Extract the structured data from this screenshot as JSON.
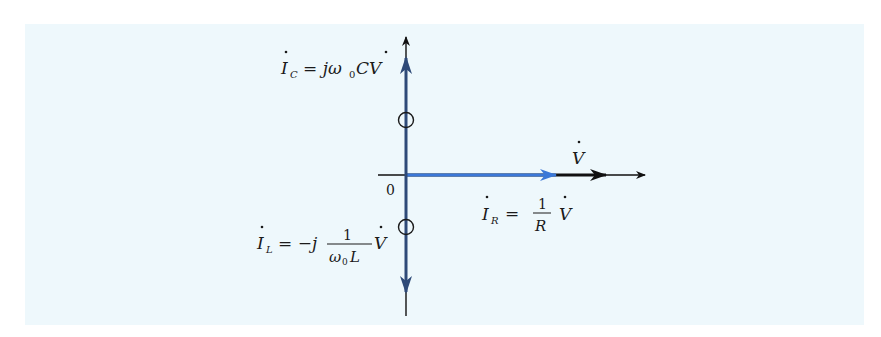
{
  "diagram": {
    "type": "phasor-diagram",
    "colors": {
      "background": "#eef8fc",
      "axis": "#111111",
      "voltage_phasor": "#111111",
      "resistor_current_phasor": "#3b78d8",
      "reactive_current_phasor": "#2e4a78"
    },
    "origin_label": "0",
    "phasors": [
      {
        "id": "V",
        "label_main": "V",
        "dot": true,
        "direction": "right",
        "magnitude_relative": 1.0
      },
      {
        "id": "IR",
        "label_lhs_main": "I",
        "label_lhs_sub": "R",
        "label_eq": "=",
        "label_frac_num": "1",
        "label_frac_den": "R",
        "label_rhs": "V",
        "direction": "right",
        "magnitude_relative": 0.8
      },
      {
        "id": "IC",
        "label_lhs_main": "I",
        "label_lhs_sub": "C",
        "label_rhs": "= jω",
        "label_rhs_sub": "0",
        "label_rhs_tail": "CV",
        "direction": "up",
        "magnitude_relative": 0.95
      },
      {
        "id": "IL",
        "label_lhs_main": "I",
        "label_lhs_sub": "L",
        "label_eq": "= −j",
        "label_frac_num": "1",
        "label_frac_den": "ω",
        "label_frac_den_sub": "0",
        "label_frac_den_tail": "L",
        "label_rhs": "V",
        "direction": "down",
        "magnitude_relative": 0.95
      }
    ],
    "cancel_marks": [
      "IC",
      "IL"
    ]
  }
}
